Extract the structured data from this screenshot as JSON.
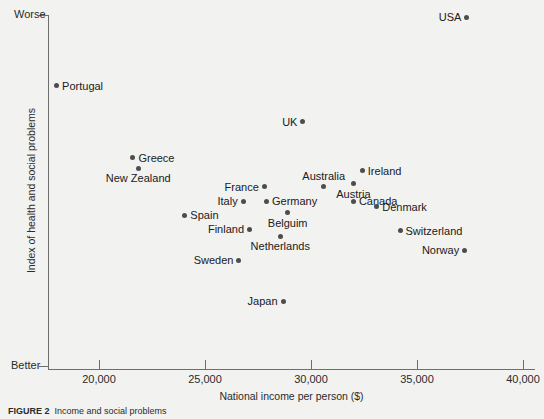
{
  "figure": {
    "caption_prefix": "FIGURE 2",
    "caption_text": "Income and social problems"
  },
  "chart_data": {
    "type": "scatter",
    "title": "",
    "xlabel": "National income per person ($)",
    "ylabel": "Index of health and social problems",
    "xlim": [
      17300,
      40600
    ],
    "ylim_labels": {
      "top": "Worse",
      "bottom": "Better"
    },
    "grid": false,
    "legend": "none",
    "xticks": [
      20000,
      25000,
      30000,
      35000,
      40000
    ],
    "xticklabels": [
      "20,000",
      "25,000",
      "30,000",
      "35,000",
      "40,000"
    ],
    "yticklabels": [
      "Worse",
      "Better"
    ],
    "marker_color": "#4d4d4d",
    "axis_color": "#6e6e6e",
    "points": [
      {
        "name": "USA",
        "x": 37350,
        "y": 0.994,
        "label_side": "left"
      },
      {
        "name": "Portugal",
        "x": 18000,
        "y": 0.798,
        "label_side": "right"
      },
      {
        "name": "UK",
        "x": 29620,
        "y": 0.696,
        "label_side": "left"
      },
      {
        "name": "Greece",
        "x": 21600,
        "y": 0.594,
        "label_side": "right"
      },
      {
        "name": "New Zealand",
        "x": 21850,
        "y": 0.563,
        "label_side": "below"
      },
      {
        "name": "Ireland",
        "x": 32420,
        "y": 0.556,
        "label_side": "right"
      },
      {
        "name": "Austria",
        "x": 32000,
        "y": 0.519,
        "label_side": "below"
      },
      {
        "name": "Australia",
        "x": 30600,
        "y": 0.51,
        "label_side": "above"
      },
      {
        "name": "France",
        "x": 27800,
        "y": 0.51,
        "label_side": "left"
      },
      {
        "name": "Italy",
        "x": 26800,
        "y": 0.47,
        "label_side": "left"
      },
      {
        "name": "Germany",
        "x": 27900,
        "y": 0.47,
        "label_side": "right"
      },
      {
        "name": "Canada",
        "x": 32000,
        "y": 0.47,
        "label_side": "right"
      },
      {
        "name": "Denmark",
        "x": 33100,
        "y": 0.453,
        "label_side": "right"
      },
      {
        "name": "Spain",
        "x": 24050,
        "y": 0.43,
        "label_side": "right"
      },
      {
        "name": "Belguim",
        "x": 28900,
        "y": 0.436,
        "label_side": "below"
      },
      {
        "name": "Finland",
        "x": 27100,
        "y": 0.389,
        "label_side": "left"
      },
      {
        "name": "Switzerland",
        "x": 34200,
        "y": 0.386,
        "label_side": "right"
      },
      {
        "name": "Netherlands",
        "x": 28550,
        "y": 0.369,
        "label_side": "below"
      },
      {
        "name": "Norway",
        "x": 37250,
        "y": 0.33,
        "label_side": "left"
      },
      {
        "name": "Sweden",
        "x": 26600,
        "y": 0.301,
        "label_side": "left"
      },
      {
        "name": "Japan",
        "x": 28680,
        "y": 0.185,
        "label_side": "left"
      }
    ]
  }
}
